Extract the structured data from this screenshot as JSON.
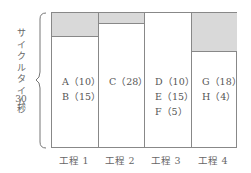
{
  "diagram": {
    "type": "cycle-time-line-balance",
    "y_axis": {
      "label": "サイクルタイム",
      "value": "30",
      "unit": "秒"
    },
    "colors": {
      "idle": "#d9d9d9",
      "border": "#888888"
    },
    "processes": [
      {
        "name": "工程 1",
        "tasks": [
          "A（10）",
          "B（15）"
        ],
        "work_time": 25,
        "idle_time": 5
      },
      {
        "name": "工程 2",
        "tasks": [
          "C（28）"
        ],
        "work_time": 28,
        "idle_time": 2
      },
      {
        "name": "工程 3",
        "tasks": [
          "D（10）",
          "E（15）",
          "F（5）"
        ],
        "work_time": 30,
        "idle_time": 0
      },
      {
        "name": "工程 4",
        "tasks": [
          "G（18）",
          "H（4）"
        ],
        "work_time": 22,
        "idle_time": 8
      }
    ]
  }
}
